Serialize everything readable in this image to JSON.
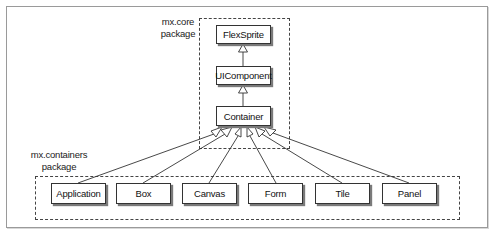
{
  "diagram": {
    "type": "uml-class-hierarchy",
    "packages": [
      {
        "id": "core",
        "label_line1": "mx.core",
        "label_line2": "package"
      },
      {
        "id": "containers",
        "label_line1": "mx.containers",
        "label_line2": "package"
      }
    ],
    "core_classes": [
      {
        "id": "flexsprite",
        "label": "FlexSprite"
      },
      {
        "id": "uicomponent",
        "label": "UIComponent"
      },
      {
        "id": "container",
        "label": "Container"
      }
    ],
    "container_classes": [
      {
        "id": "application",
        "label": "Application"
      },
      {
        "id": "box",
        "label": "Box"
      },
      {
        "id": "canvas",
        "label": "Canvas"
      },
      {
        "id": "form",
        "label": "Form"
      },
      {
        "id": "tile",
        "label": "Tile"
      },
      {
        "id": "panel",
        "label": "Panel"
      }
    ],
    "edges": [
      {
        "from": "UIComponent",
        "to": "FlexSprite",
        "type": "inheritance"
      },
      {
        "from": "Container",
        "to": "UIComponent",
        "type": "inheritance"
      },
      {
        "from": "Application",
        "to": "Container",
        "type": "inheritance"
      },
      {
        "from": "Box",
        "to": "Container",
        "type": "inheritance"
      },
      {
        "from": "Canvas",
        "to": "Container",
        "type": "inheritance"
      },
      {
        "from": "Form",
        "to": "Container",
        "type": "inheritance"
      },
      {
        "from": "Tile",
        "to": "Container",
        "type": "inheritance"
      },
      {
        "from": "Panel",
        "to": "Container",
        "type": "inheritance"
      }
    ],
    "colors": {
      "line": "#333333",
      "dash": "#444444",
      "shadow": "#7a7a7a"
    }
  }
}
